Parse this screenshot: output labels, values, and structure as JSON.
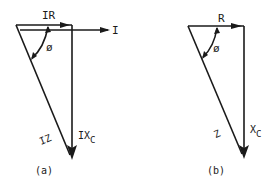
{
  "diagrams": [
    {
      "id": "a",
      "caption": "(a)",
      "labels": {
        "top": "IR",
        "horizontal_arrow": "I",
        "angle": "ø",
        "hypotenuse": "IZ",
        "vertical_main": "IX",
        "vertical_sub": "C"
      }
    },
    {
      "id": "b",
      "caption": "(b)",
      "labels": {
        "top": "R",
        "angle": "ø",
        "hypotenuse": "Z",
        "vertical_main": "X",
        "vertical_sub": "C"
      }
    }
  ],
  "colors": {
    "stroke": "#1a1a1a",
    "background": "#ffffff"
  }
}
